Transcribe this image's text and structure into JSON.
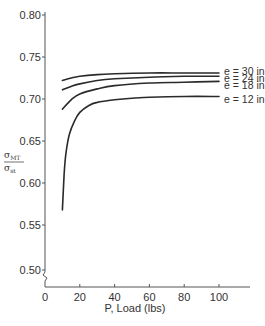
{
  "chart_data": {
    "type": "line",
    "title": "",
    "xlabel": "P, Load (lbs)",
    "ylabel": "σMT / σst",
    "ylabel_num": "σ",
    "ylabel_num_sub": "MT",
    "ylabel_den": "σ",
    "ylabel_den_sub": "st",
    "xlim": [
      0,
      115
    ],
    "ylim": [
      0.49,
      0.8
    ],
    "y_axis_break": true,
    "grid": false,
    "legend_position": "inline-right",
    "x_ticks": [
      0,
      20,
      40,
      60,
      80,
      100
    ],
    "x_tick_labels": [
      "0",
      "20",
      "40",
      "60",
      "80",
      "100"
    ],
    "y_ticks": [
      0.8,
      0.75,
      0.7,
      0.65,
      0.6,
      0.55,
      0.5
    ],
    "y_tick_labels": [
      "0.80",
      "0.75",
      "0.70",
      "0.65",
      "0.60",
      "0.55",
      "0.50"
    ],
    "series": [
      {
        "name": "e = 30 in",
        "x": [
          10,
          15,
          20,
          30,
          40,
          60,
          80,
          100
        ],
        "values": [
          0.722,
          0.725,
          0.727,
          0.729,
          0.73,
          0.731,
          0.731,
          0.731
        ]
      },
      {
        "name": "e = 24 in",
        "x": [
          10,
          15,
          20,
          30,
          40,
          60,
          80,
          100
        ],
        "values": [
          0.711,
          0.715,
          0.718,
          0.722,
          0.724,
          0.726,
          0.727,
          0.727
        ]
      },
      {
        "name": "e = 18 in",
        "x": [
          10,
          15,
          20,
          30,
          40,
          60,
          80,
          100
        ],
        "values": [
          0.688,
          0.699,
          0.706,
          0.712,
          0.716,
          0.719,
          0.72,
          0.721
        ]
      },
      {
        "name": "e = 12 in",
        "x": [
          10,
          11,
          12,
          14,
          17,
          20,
          25,
          30,
          40,
          50,
          60,
          80,
          100
        ],
        "values": [
          0.568,
          0.61,
          0.635,
          0.658,
          0.674,
          0.684,
          0.692,
          0.696,
          0.699,
          0.701,
          0.702,
          0.703,
          0.703
        ]
      }
    ]
  },
  "colors": {
    "line": "#2a2a2a",
    "axis": "#555555",
    "text": "#333333"
  }
}
